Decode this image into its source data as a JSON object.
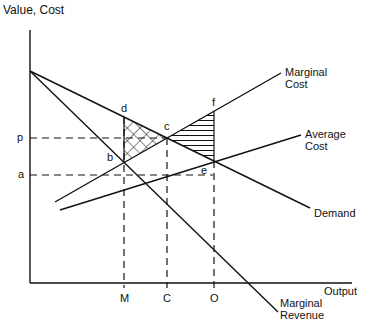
{
  "diagram": {
    "y_axis_label": "Value, Cost",
    "x_axis_label": "Output",
    "curves": {
      "marginal_cost": [
        "Marginal",
        "Cost"
      ],
      "average_cost": [
        "Average",
        "Cost"
      ],
      "demand": "Demand",
      "marginal_revenue": [
        "Marginal",
        "Revenue"
      ]
    },
    "y_ticks": {
      "p": "p",
      "a": "a"
    },
    "x_ticks": {
      "M": "M",
      "C": "C",
      "O": "O"
    },
    "points": {
      "b": "b",
      "c": "c",
      "d": "d",
      "e": "e",
      "f": "f"
    },
    "shading": {
      "cross_hatched_triangle": "b-c-d",
      "horizontal_hatched_triangle": "c-e-f"
    }
  }
}
